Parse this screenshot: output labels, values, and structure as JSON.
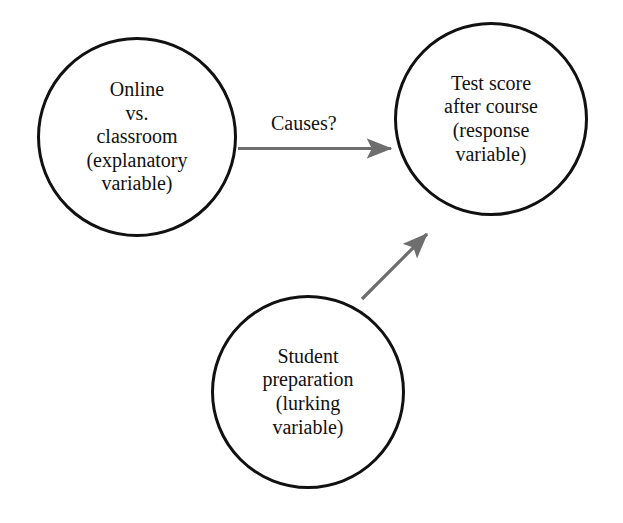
{
  "diagram": {
    "background_color": "#ffffff",
    "node_stroke_color": "#111111",
    "arrow_color": "#6e6e6e",
    "text_color": "#111111",
    "nodes": [
      {
        "id": "explanatory",
        "role": "explanatory variable",
        "lines": [
          "Online",
          "vs.",
          "classroom",
          "(explanatory",
          "variable)"
        ]
      },
      {
        "id": "response",
        "role": "response variable",
        "lines": [
          "Test score",
          "after course",
          "(response",
          "variable)"
        ]
      },
      {
        "id": "lurking",
        "role": "lurking variable",
        "lines": [
          "Student",
          "preparation",
          "(lurking",
          "variable)"
        ]
      }
    ],
    "edges": [
      {
        "id": "causes-edge",
        "from": "explanatory",
        "to": "response",
        "label": "Causes?",
        "style": "straight-arrow"
      },
      {
        "id": "lurking-edge",
        "from": "lurking",
        "to": "response",
        "label": "",
        "style": "diagonal-arrow"
      }
    ]
  }
}
